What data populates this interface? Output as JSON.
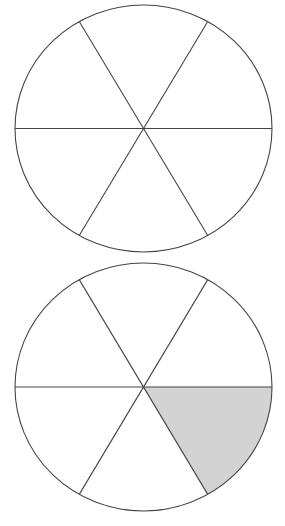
{
  "colors": {
    "background": "#ffffff",
    "stroke": "#444444",
    "fill_empty": "#ffffff",
    "fill_shaded": "#d3d3d3"
  },
  "stroke_width": 1.1,
  "diagrams": [
    {
      "name": "circle-top",
      "cx": 143.5,
      "cy": 128.5,
      "rx": 128.5,
      "ry": 123.5,
      "divisions": 6,
      "shaded_sectors": []
    },
    {
      "name": "circle-bottom",
      "cx": 143.5,
      "cy": 387,
      "rx": 128.5,
      "ry": 124,
      "divisions": 6,
      "shaded_sectors": [
        0
      ]
    }
  ],
  "description": {
    "top": "Circle divided into 6 equal parts, none shaded",
    "bottom": "Circle divided into 6 equal parts, 1 shaded (1/6)"
  }
}
